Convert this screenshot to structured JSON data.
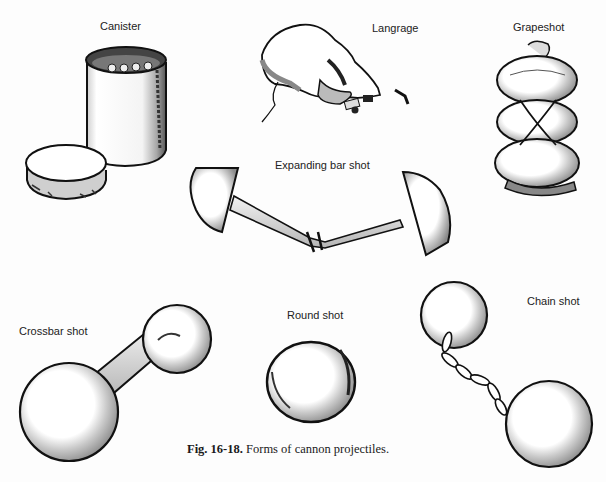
{
  "figure": {
    "labels": {
      "canister": "Canister",
      "langrage": "Langrage",
      "grapeshot": "Grapeshot",
      "expanding_bar_shot": "Expanding bar shot",
      "crossbar_shot": "Crossbar shot",
      "round_shot": "Round shot",
      "chain_shot": "Chain shot"
    },
    "caption": {
      "number": "Fig. 16-18.",
      "text": "Forms of cannon projectiles."
    }
  }
}
